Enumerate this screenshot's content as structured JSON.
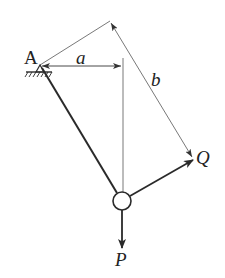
{
  "diagram": {
    "type": "mechanics-statics",
    "labels": {
      "pivot": "A",
      "horizontal_distance": "a",
      "perpendicular_distance": "b",
      "force_q": "Q",
      "force_p": "P"
    },
    "colors": {
      "stroke": "#2a2a2a",
      "thin_stroke": "#555555",
      "background": "#ffffff"
    },
    "elements": [
      {
        "name": "pin-support-A",
        "kind": "fixed pin support with hatched ground"
      },
      {
        "name": "rod",
        "kind": "thick bar from A to ring"
      },
      {
        "name": "ring",
        "kind": "small circle / joint"
      },
      {
        "name": "force-Q",
        "kind": "arrow from ring up-right"
      },
      {
        "name": "force-P",
        "kind": "arrow from ring downward"
      },
      {
        "name": "dimension-a",
        "kind": "horizontal dimension from A to vertical line of P"
      },
      {
        "name": "dimension-b",
        "kind": "perpendicular dimension from A to line of Q"
      }
    ]
  }
}
